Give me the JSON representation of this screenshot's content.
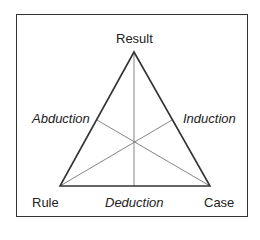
{
  "diagram": {
    "vertices": {
      "top": "Result",
      "bottom_left": "Rule",
      "bottom_right": "Case"
    },
    "sides": {
      "left": "Abduction",
      "right": "Induction",
      "bottom": "Deduction"
    },
    "colors": {
      "triangle": "#333333",
      "medians": "#777777",
      "frame": "#333333"
    }
  }
}
